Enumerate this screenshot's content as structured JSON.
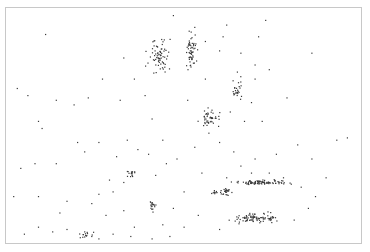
{
  "map": {
    "type": "dot-density",
    "dot_color": "#3a3a3a",
    "frame_color": "#c8c8c8",
    "background": "#ffffff",
    "x_range": [
      0,
      1
    ],
    "y_range": [
      0,
      1
    ],
    "points": [
      [
        0.11,
        0.11
      ],
      [
        0.73,
        0.05
      ],
      [
        0.86,
        0.19
      ],
      [
        0.47,
        0.03
      ],
      [
        0.53,
        0.08
      ],
      [
        0.61,
        0.12
      ],
      [
        0.32,
        0.39
      ],
      [
        0.06,
        0.37
      ],
      [
        0.08,
        0.66
      ],
      [
        0.33,
        0.21
      ],
      [
        0.23,
        0.38
      ],
      [
        0.19,
        0.41
      ],
      [
        0.14,
        0.39
      ],
      [
        0.27,
        0.3
      ],
      [
        0.1,
        0.51
      ],
      [
        0.09,
        0.48
      ],
      [
        0.36,
        0.3
      ],
      [
        0.39,
        0.37
      ],
      [
        0.41,
        0.47
      ],
      [
        0.56,
        0.3
      ],
      [
        0.51,
        0.39
      ],
      [
        0.63,
        0.44
      ],
      [
        0.69,
        0.4
      ],
      [
        0.67,
        0.48
      ],
      [
        0.72,
        0.48
      ],
      [
        0.79,
        0.38
      ],
      [
        0.82,
        0.58
      ],
      [
        0.93,
        0.56
      ],
      [
        0.96,
        0.55
      ],
      [
        0.86,
        0.64
      ],
      [
        0.52,
        0.18
      ],
      [
        0.56,
        0.14
      ],
      [
        0.6,
        0.18
      ],
      [
        0.66,
        0.19
      ],
      [
        0.7,
        0.3
      ],
      [
        0.74,
        0.26
      ],
      [
        0.7,
        0.24
      ],
      [
        0.65,
        0.27
      ],
      [
        0.71,
        0.12
      ],
      [
        0.62,
        0.07
      ],
      [
        0.09,
        0.8
      ],
      [
        0.15,
        0.87
      ],
      [
        0.17,
        0.82
      ],
      [
        0.24,
        0.83
      ],
      [
        0.26,
        0.79
      ],
      [
        0.3,
        0.78
      ],
      [
        0.33,
        0.74
      ],
      [
        0.29,
        0.73
      ],
      [
        0.22,
        0.61
      ],
      [
        0.26,
        0.57
      ],
      [
        0.2,
        0.57
      ],
      [
        0.14,
        0.66
      ],
      [
        0.09,
        0.93
      ],
      [
        0.13,
        0.95
      ],
      [
        0.17,
        0.94
      ],
      [
        0.22,
        0.95
      ],
      [
        0.28,
        0.88
      ],
      [
        0.33,
        0.86
      ],
      [
        0.36,
        0.93
      ],
      [
        0.44,
        0.92
      ],
      [
        0.47,
        0.85
      ],
      [
        0.5,
        0.78
      ],
      [
        0.55,
        0.7
      ],
      [
        0.62,
        0.72
      ],
      [
        0.69,
        0.7
      ],
      [
        0.76,
        0.62
      ],
      [
        0.85,
        0.85
      ],
      [
        0.9,
        0.72
      ],
      [
        0.81,
        0.9
      ],
      [
        0.6,
        0.94
      ],
      [
        0.42,
        0.71
      ],
      [
        0.45,
        0.66
      ],
      [
        0.4,
        0.62
      ],
      [
        0.37,
        0.6
      ],
      [
        0.31,
        0.63
      ],
      [
        0.34,
        0.56
      ],
      [
        0.44,
        0.56
      ],
      [
        0.48,
        0.64
      ],
      [
        0.53,
        0.59
      ],
      [
        0.57,
        0.53
      ],
      [
        0.6,
        0.57
      ],
      [
        0.64,
        0.61
      ],
      [
        0.66,
        0.67
      ],
      [
        0.7,
        0.64
      ],
      [
        0.74,
        0.7
      ],
      [
        0.78,
        0.72
      ],
      [
        0.83,
        0.76
      ],
      [
        0.87,
        0.8
      ],
      [
        0.54,
        0.88
      ],
      [
        0.5,
        0.93
      ],
      [
        0.24,
        0.97
      ],
      [
        0.26,
        0.98
      ],
      [
        0.3,
        0.96
      ],
      [
        0.35,
        0.97
      ],
      [
        0.41,
        0.98
      ],
      [
        0.46,
        0.97
      ],
      [
        0.04,
        0.68
      ],
      [
        0.03,
        0.34
      ],
      [
        0.02,
        0.8
      ],
      [
        0.05,
        0.96
      ]
    ],
    "clusters": [
      {
        "name": "north-west-cluster",
        "center": [
          0.43,
          0.2
        ],
        "spread": [
          0.05,
          0.1
        ],
        "count": 70
      },
      {
        "name": "north-ridge-cluster",
        "center": [
          0.52,
          0.18
        ],
        "spread": [
          0.02,
          0.1
        ],
        "count": 60
      },
      {
        "name": "central-cluster",
        "center": [
          0.57,
          0.47
        ],
        "spread": [
          0.04,
          0.05
        ],
        "count": 45
      },
      {
        "name": "center-east-cluster",
        "center": [
          0.65,
          0.35
        ],
        "spread": [
          0.02,
          0.07
        ],
        "count": 25
      },
      {
        "name": "south-band-cluster",
        "center": [
          0.72,
          0.74
        ],
        "spread": [
          0.1,
          0.015
        ],
        "count": 90
      },
      {
        "name": "south-west-band-cluster",
        "center": [
          0.61,
          0.78
        ],
        "spread": [
          0.04,
          0.02
        ],
        "count": 35
      },
      {
        "name": "south-east-cluster",
        "center": [
          0.7,
          0.89
        ],
        "spread": [
          0.09,
          0.03
        ],
        "count": 90
      },
      {
        "name": "west-south-cluster",
        "center": [
          0.35,
          0.7
        ],
        "spread": [
          0.02,
          0.02
        ],
        "count": 15
      },
      {
        "name": "mid-south-cluster",
        "center": [
          0.41,
          0.84
        ],
        "spread": [
          0.015,
          0.035
        ],
        "count": 18
      },
      {
        "name": "lower-left-cluster",
        "center": [
          0.22,
          0.96
        ],
        "spread": [
          0.03,
          0.02
        ],
        "count": 14
      }
    ]
  }
}
